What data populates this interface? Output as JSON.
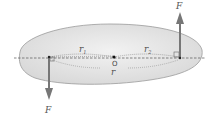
{
  "diagram": {
    "labels": {
      "force_top": "F",
      "force_bottom": "F",
      "r1": "r",
      "r1_sub": "1",
      "r2": "r",
      "r2_sub": "2",
      "origin": "O",
      "r": "r"
    },
    "colors": {
      "body_fill": "#e6e6e6",
      "body_stroke": "#9a9a9a",
      "arrow": "#777777",
      "dashed": "#555555"
    }
  }
}
